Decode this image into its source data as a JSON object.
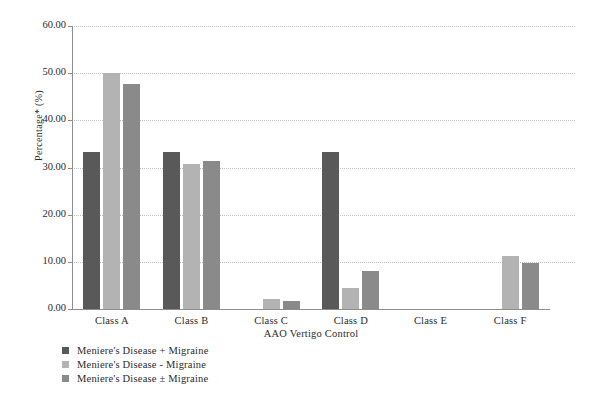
{
  "chart_data": {
    "type": "bar",
    "title": "",
    "xlabel": "AAO Vertigo Control",
    "ylabel": "Percentage* (%)",
    "categories": [
      "Class A",
      "Class B",
      "Class C",
      "Class D",
      "Class E",
      "Class F"
    ],
    "series": [
      {
        "name": "Meniere's Disease + Migraine",
        "color": "#595959",
        "values": [
          33.3,
          33.3,
          0.0,
          33.3,
          0.0,
          0.0
        ]
      },
      {
        "name": "Meniere's Disease - Migraine",
        "color": "#b3b3b3",
        "values": [
          50.0,
          30.8,
          2.1,
          4.5,
          0.0,
          11.2
        ]
      },
      {
        "name": "Meniere's Disease ± Migraine",
        "color": "#8a8a8a",
        "values": [
          47.8,
          31.4,
          1.8,
          8.0,
          0.0,
          9.8
        ]
      }
    ],
    "ylim": [
      0,
      60
    ],
    "yticks": [
      "0.00",
      "10.00",
      "20.00",
      "30.00",
      "40.00",
      "50.00",
      "60.00"
    ],
    "ytick_values": [
      0,
      10,
      20,
      30,
      40,
      50,
      60
    ],
    "grid": true,
    "grid_axis": "y",
    "grid_style": "dotted",
    "legend_position": "bottom-left",
    "background": "#ffffff",
    "axis_color": "#8d8d8d",
    "grid_color": "#c2c2c2"
  }
}
